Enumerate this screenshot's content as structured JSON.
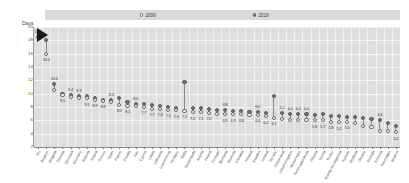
{
  "axis_title": "Days",
  "legend": {
    "series": [
      {
        "key": "s2009",
        "label": "2009",
        "marker": "open-circle-icon"
      },
      {
        "key": "s2019",
        "label": "2019",
        "marker": "filled-circle-icon"
      }
    ]
  },
  "chart_data": {
    "type": "scatter",
    "title": "",
    "subtitle": "",
    "xlabel": "",
    "ylabel": "Days",
    "ylim": [
      2,
      20
    ],
    "yticks": [
      2,
      4,
      6,
      8,
      10,
      12,
      14,
      16,
      18,
      20
    ],
    "grid": true,
    "legend_position": "top",
    "annotation": "arrow-marker",
    "categories": [
      "EU",
      "Belgium",
      "Bulgaria",
      "Czechia",
      "Denmark",
      "Germany",
      "Estonia",
      "Ireland",
      "Greece",
      "Spain",
      "France",
      "Croatia",
      "Italy",
      "Cyprus",
      "Latvia",
      "Lithuania",
      "Luxembourg",
      "Hungary",
      "Malta",
      "Netherlands",
      "Austria",
      "Poland",
      "Portugal",
      "Romania",
      "Slovenia",
      "Slovakia",
      "Finland",
      "Sweden",
      "Iceland",
      "Norway",
      "Switzerland",
      "United Kingdom",
      "Montenegro",
      "North Macedonia",
      "Albania",
      "Serbia",
      "Turkey",
      "Bosnia Herzegovina",
      "Kosovo",
      "Moldova",
      "Ukraine",
      "Georgia",
      "Armenia",
      "Azerbaijan",
      "Belarus"
    ],
    "series": [
      {
        "name": "2009",
        "marker": "open-circle",
        "values": [
          18.5,
          18.0,
          11.5,
          10.0,
          9.8,
          9.7,
          9.6,
          9.4,
          9.1,
          9.0,
          9.3,
          8.7,
          8.5,
          8.4,
          8.3,
          8.2,
          8.0,
          7.8,
          11.8,
          7.9,
          7.8,
          7.7,
          7.6,
          7.5,
          7.4,
          7.4,
          7.3,
          7.2,
          7.1,
          9.6,
          7.1,
          7.0,
          7.0,
          6.9,
          6.8,
          6.9,
          6.7,
          6.6,
          6.5,
          6.5,
          6.4,
          6.2,
          6.0,
          5.6,
          5.2
        ]
      },
      {
        "name": "2019",
        "marker": "filled-circle",
        "values": [
          18.5,
          16.0,
          10.6,
          9.8,
          9.5,
          9.4,
          9.3,
          9.1,
          8.9,
          8.8,
          8.3,
          8.2,
          8.1,
          8.0,
          7.7,
          7.7,
          7.6,
          7.5,
          7.4,
          7.2,
          7.2,
          7.1,
          7.0,
          6.9,
          6.9,
          6.9,
          6.8,
          6.8,
          6.6,
          6.4,
          6.2,
          6.1,
          6.1,
          6.0,
          6.0,
          6.0,
          5.8,
          5.7,
          5.8,
          5.6,
          5.2,
          5.0,
          4.4,
          4.4,
          4.2
        ]
      }
    ],
    "data_labels": {
      "s2009": [
        "18.5",
        "",
        "10.6",
        "",
        "9.4",
        "9.3",
        "",
        "",
        "",
        "8.3",
        "",
        "",
        "8.0",
        "",
        "",
        "",
        "",
        "",
        "",
        "",
        "",
        "",
        "",
        "6.8",
        "",
        "",
        "",
        "6.6",
        "",
        "",
        "6.1",
        "6.0",
        "6.0",
        "6.0",
        "",
        "",
        "",
        "",
        "",
        "",
        "",
        "",
        "4.4",
        "",
        ""
      ],
      "s2019": [
        "",
        "16.0",
        "",
        "9.5",
        "",
        "",
        "9.1",
        "8.9",
        "8.8",
        "",
        "8.2",
        "8.1",
        "",
        "7.7",
        "7.7",
        "7.6",
        "7.5",
        "7.4",
        "7.2",
        "7.2",
        "7.1",
        "7.0",
        "",
        "6.9",
        "6.9",
        "6.8",
        "",
        "6.4",
        "6.2",
        "6.1",
        "",
        "",
        "",
        "",
        "5.8",
        "5.7",
        "5.8",
        "5.2",
        "5.0",
        "",
        "",
        "",
        "",
        "",
        "4.2"
      ]
    }
  }
}
